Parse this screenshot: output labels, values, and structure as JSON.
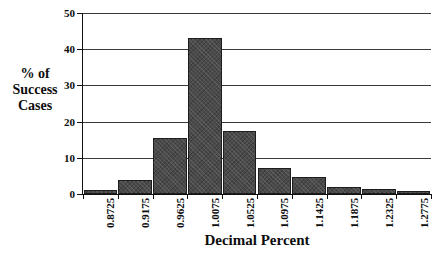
{
  "chart_data": {
    "type": "bar",
    "title": "",
    "xlabel": "Decimal Percent",
    "ylabel": "% of Success Cases",
    "ylabel_lines": [
      "% of",
      "Success",
      "Cases"
    ],
    "categories": [
      "0.8725",
      "0.9175",
      "0.9625",
      "1.0075",
      "1.0525",
      "1.0975",
      "1.1425",
      "1.1875",
      "1.2325",
      "1.2775"
    ],
    "values": [
      1.1,
      3.8,
      15.4,
      43.1,
      17.3,
      7.3,
      4.7,
      1.9,
      1.5,
      0.8
    ],
    "ylim": [
      0,
      50
    ],
    "yticks": [
      0,
      10,
      20,
      30,
      40,
      50
    ],
    "ytick_labels": [
      "0",
      "10",
      "20",
      "30",
      "40",
      "50"
    ],
    "grid": true,
    "grid_axis": "y",
    "legend": "none",
    "bar_color": "#4a4a4a",
    "bar_edge_color": "#1d1d1d",
    "axis_color": "#111111",
    "background_color": "#ffffff",
    "xtick_label_rotation": -90
  }
}
